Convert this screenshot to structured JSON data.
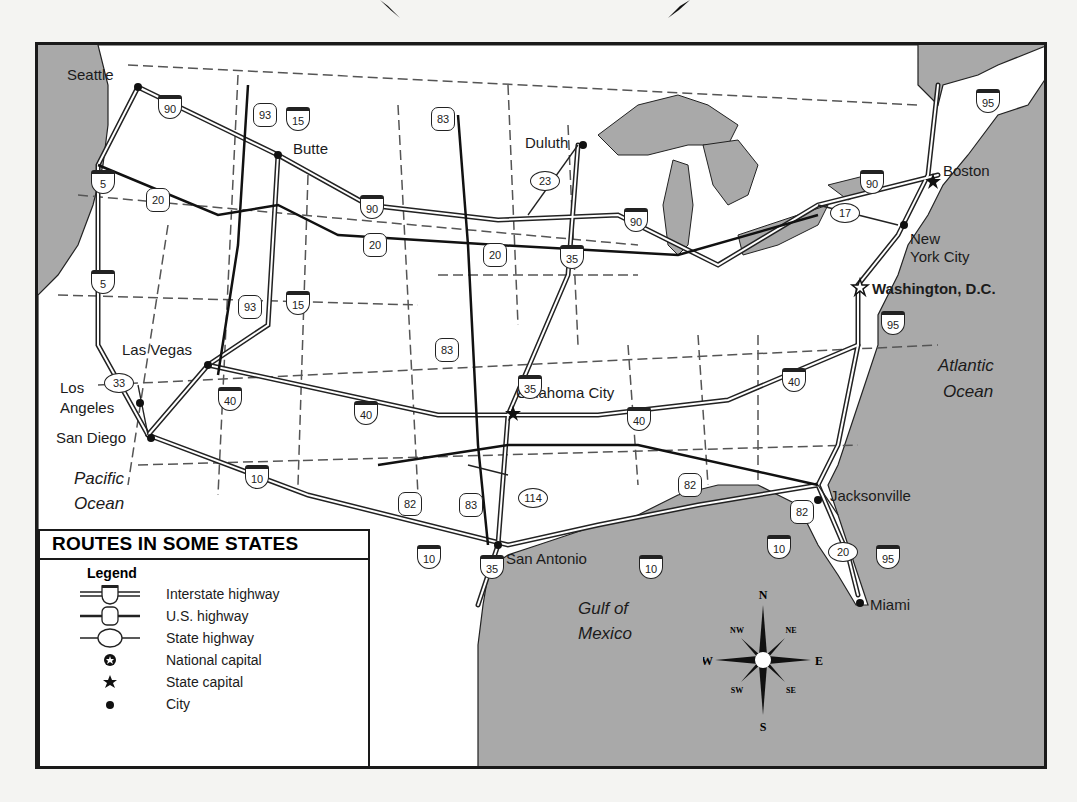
{
  "title": "ROUTES IN SOME STATES",
  "legend": {
    "heading": "Legend",
    "items": [
      {
        "symbol": "interstate-shield-icon",
        "label": "Interstate highway"
      },
      {
        "symbol": "us-highway-shield-icon",
        "label": "U.S. highway"
      },
      {
        "symbol": "state-highway-oval-icon",
        "label": "State highway"
      },
      {
        "symbol": "national-capital-icon",
        "label": "National capital"
      },
      {
        "symbol": "state-capital-star-icon",
        "label": "State capital"
      },
      {
        "symbol": "city-dot-icon",
        "label": "City"
      }
    ]
  },
  "cities": [
    {
      "name": "Seattle",
      "type": "city"
    },
    {
      "name": "Butte",
      "type": "city"
    },
    {
      "name": "Duluth",
      "type": "city"
    },
    {
      "name": "Boston",
      "type": "state-capital"
    },
    {
      "name": "New York City",
      "type": "city"
    },
    {
      "name": "Washington, D.C.",
      "type": "national-capital"
    },
    {
      "name": "Las Vegas",
      "type": "city"
    },
    {
      "name": "Los Angeles",
      "type": "city"
    },
    {
      "name": "San Diego",
      "type": "city"
    },
    {
      "name": "Oklahoma City",
      "type": "state-capital"
    },
    {
      "name": "San Antonio",
      "type": "city"
    },
    {
      "name": "Jacksonville",
      "type": "city"
    },
    {
      "name": "Miami",
      "type": "city"
    }
  ],
  "labels": {
    "seattle": "Seattle",
    "butte": "Butte",
    "duluth": "Duluth",
    "boston": "Boston",
    "nyc_1": "New",
    "nyc_2": "York City",
    "dc": "Washington, D.C.",
    "las_vegas": "Las Vegas",
    "la_1": "Los",
    "la_2": "Angeles",
    "san_diego": "San Diego",
    "okc": "Oklahoma City",
    "san_antonio": "San Antonio",
    "jacksonville": "Jacksonville",
    "miami": "Miami"
  },
  "water": {
    "pacific_1": "Pacific",
    "pacific_2": "Ocean",
    "atlantic_1": "Atlantic",
    "atlantic_2": "Ocean",
    "gulf_1": "Gulf of",
    "gulf_2": "Mexico"
  },
  "shields": {
    "i90_a": "90",
    "i90_b": "90",
    "i90_c": "90",
    "i90_d": "90",
    "us93_a": "93",
    "us93_b": "93",
    "i15_a": "15",
    "i15_b": "15",
    "i5_a": "5",
    "i5_b": "5",
    "us20_a": "20",
    "us20_b": "20",
    "us20_c": "20",
    "us83_a": "83",
    "us83_b": "83",
    "us83_c": "83",
    "s23": "23",
    "i35_a": "35",
    "i35_b": "35",
    "i35_c": "35",
    "s17": "17",
    "i95_a": "95",
    "i95_b": "95",
    "i95_c": "95",
    "s33": "33",
    "i40_a": "40",
    "i40_b": "40",
    "i40_c": "40",
    "i40_d": "40",
    "i10_a": "10",
    "i10_b": "10",
    "i10_c": "10",
    "i10_d": "10",
    "us82_a": "82",
    "us82_b": "82",
    "us82_c": "82",
    "s114": "114",
    "s20": "20"
  },
  "compass": {
    "n": "N",
    "s": "S",
    "e": "E",
    "w": "W",
    "ne": "NE",
    "nw": "NW",
    "se": "SE",
    "sw": "SW"
  },
  "colors": {
    "water": "#a9a9a9",
    "land": "#ffffff",
    "border": "#1a1a1a"
  }
}
